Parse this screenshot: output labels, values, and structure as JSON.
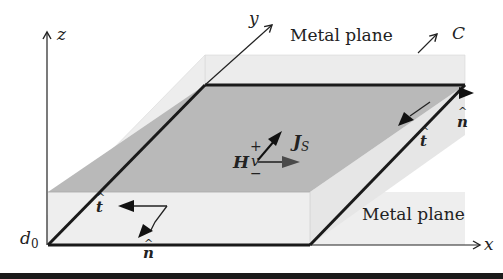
{
  "diagram": {
    "axes": {
      "x_label": "x",
      "y_label": "y",
      "z_label": "z",
      "origin_height_label": "d",
      "origin_height_subscript": "0"
    },
    "labels": {
      "top_plane": "Metal plane",
      "bottom_plane": "Metal plane",
      "contour": "C",
      "plus": "+",
      "minus": "−",
      "voltage": "v",
      "current_density": "J",
      "current_density_subscript": "S",
      "magnetic_field": "H",
      "tangent_hat": "t̂",
      "normal_hat": "n̂",
      "hat": "^",
      "t": "t",
      "n": "n"
    },
    "colors": {
      "dark_plane": "#b9b9b9",
      "light_plane": "#e9e9e9",
      "edge": "#1a1a1a",
      "arrow": "#222222",
      "h_arrow": "#4a4a4a"
    }
  }
}
